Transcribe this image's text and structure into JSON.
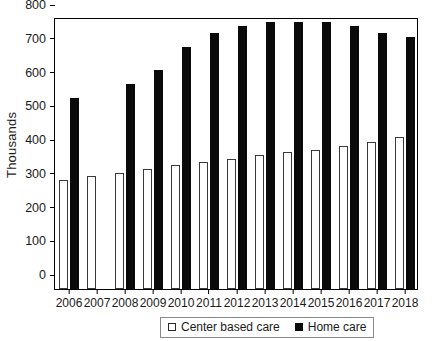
{
  "chart_data": {
    "type": "bar",
    "title": "",
    "xlabel": "",
    "ylabel": "Thousands",
    "ylim": [
      0,
      800
    ],
    "ytick_step": 100,
    "yticks": [
      0,
      100,
      200,
      300,
      400,
      500,
      600,
      700,
      800
    ],
    "grid": false,
    "legend_position": "bottom-center",
    "categories": [
      "2006",
      "2007",
      "2008",
      "2009",
      "2010",
      "2011",
      "2012",
      "2013",
      "2014",
      "2015",
      "2016",
      "2017",
      "2018"
    ],
    "series": [
      {
        "name": "Center based care",
        "color": "#ffffff",
        "edge_color": "#3a3a3a",
        "values": [
          322,
          335,
          345,
          355,
          368,
          375,
          385,
          397,
          405,
          413,
          425,
          437,
          450
        ]
      },
      {
        "name": "Home care",
        "color": "#0a0a0a",
        "edge_color": "#0a0a0a",
        "values": [
          567,
          null,
          607,
          648,
          717,
          760,
          778,
          792,
          792,
          791,
          780,
          760,
          748
        ]
      }
    ]
  },
  "legend": {
    "entries": [
      {
        "label": "Center based care",
        "swatch": "open-square-swatch"
      },
      {
        "label": "Home care",
        "swatch": "filled-square-swatch"
      }
    ]
  }
}
